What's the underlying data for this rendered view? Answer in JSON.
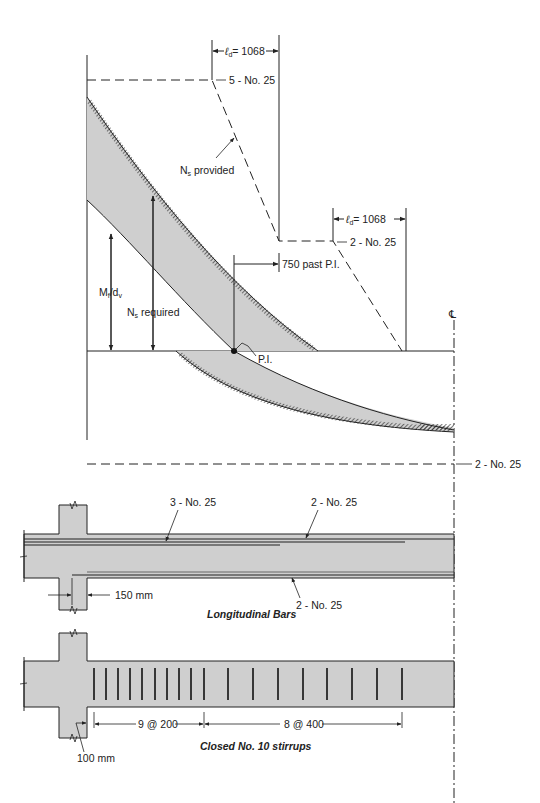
{
  "diagram": {
    "top_panel": {
      "labels": {
        "ld_top": "= 1068",
        "ld_top_symbol": "ℓ",
        "ld_top_sub": "d",
        "bars_top": "5 - No. 25",
        "ns_provided": "N",
        "ns_provided_sub": "s",
        "ns_provided_rest": " provided",
        "ld_mid": "= 1068",
        "ld_mid_symbol": "ℓ",
        "ld_mid_sub": "d",
        "bars_mid": "2 - No. 25",
        "past_pi": "750 past P.I.",
        "mu_dv_M": "M",
        "mu_dv_sub1": "f",
        "mu_dv_d": "/d",
        "mu_dv_sub2": "v",
        "ns_required": "N",
        "ns_required_sub": "s",
        "ns_required_rest": " required",
        "pi": "P.I.",
        "centerline": "℄",
        "bars_bottom": "2 - No. 25"
      }
    },
    "longitudinal_panel": {
      "caption": "Longitudinal Bars",
      "labels": {
        "top_bars_left": "3 - No. 25",
        "top_bars_right": "2 - No. 25",
        "bottom_bars": "2 - No. 25",
        "offset": "150 mm"
      }
    },
    "stirrup_panel": {
      "caption": "Closed No. 10 stirrups",
      "labels": {
        "spacing_1": "9 @ 200",
        "spacing_2": "8 @ 400",
        "offset": "100 mm"
      }
    },
    "colors": {
      "ink": "#222222",
      "fill_gray": "#cfcfcf"
    }
  }
}
